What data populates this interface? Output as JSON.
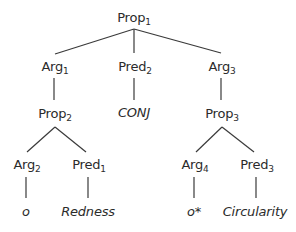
{
  "diagram": {
    "type": "tree",
    "nodes": {
      "prop1": {
        "label": "Prop",
        "sub": "1"
      },
      "arg1": {
        "label": "Arg",
        "sub": "1"
      },
      "pred2": {
        "label": "Pred",
        "sub": "2"
      },
      "arg3": {
        "label": "Arg",
        "sub": "3"
      },
      "prop2": {
        "label": "Prop",
        "sub": "2"
      },
      "conj": {
        "label": "CONJ"
      },
      "prop3": {
        "label": "Prop",
        "sub": "3"
      },
      "arg2": {
        "label": "Arg",
        "sub": "2"
      },
      "pred1": {
        "label": "Pred",
        "sub": "1"
      },
      "arg4": {
        "label": "Arg",
        "sub": "4"
      },
      "pred3": {
        "label": "Pred",
        "sub": "3"
      },
      "o": {
        "label": "o"
      },
      "redness": {
        "label": "Redness"
      },
      "o_star": {
        "label": "o*"
      },
      "circularity": {
        "label": "Circularity"
      }
    },
    "edges": [
      [
        "prop1",
        "arg1"
      ],
      [
        "prop1",
        "pred2"
      ],
      [
        "prop1",
        "arg3"
      ],
      [
        "arg1",
        "prop2"
      ],
      [
        "pred2",
        "conj"
      ],
      [
        "arg3",
        "prop3"
      ],
      [
        "prop2",
        "arg2"
      ],
      [
        "prop2",
        "pred1"
      ],
      [
        "prop3",
        "arg4"
      ],
      [
        "prop3",
        "pred3"
      ],
      [
        "arg2",
        "o"
      ],
      [
        "pred1",
        "redness"
      ],
      [
        "arg4",
        "o_star"
      ],
      [
        "pred3",
        "circularity"
      ]
    ],
    "colors": {
      "line": "#3a3a3a",
      "text": "#2b2b2b",
      "background": "#ffffff"
    }
  }
}
